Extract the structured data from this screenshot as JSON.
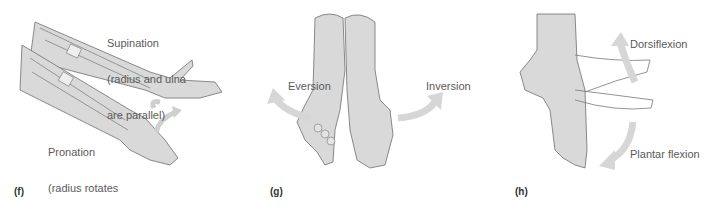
{
  "panels": [
    {
      "id": "f",
      "label": "(f)",
      "annotations": [
        {
          "title": "Supination",
          "lines": [
            "Supination",
            "(radius and ulna",
            "are parallel)"
          ]
        },
        {
          "title": "Pronation",
          "lines": [
            "Pronation",
            "(radius rotates",
            "over ulna)"
          ]
        }
      ]
    },
    {
      "id": "g",
      "label": "(g)",
      "annotations": [
        {
          "title": "Eversion",
          "lines": [
            "Eversion"
          ]
        },
        {
          "title": "Inversion",
          "lines": [
            "Inversion"
          ]
        }
      ]
    },
    {
      "id": "h",
      "label": "(h)",
      "annotations": [
        {
          "title": "Dorsiflexion",
          "lines": [
            "Dorsiflexion"
          ]
        },
        {
          "title": "Plantar flexion",
          "lines": [
            "Plantar flexion"
          ]
        }
      ]
    }
  ],
  "colors": {
    "skin": "#d9d9d9",
    "outline": "#6e6e6e",
    "arrow": "#d6d6d6",
    "text": "#5a5a5a"
  }
}
